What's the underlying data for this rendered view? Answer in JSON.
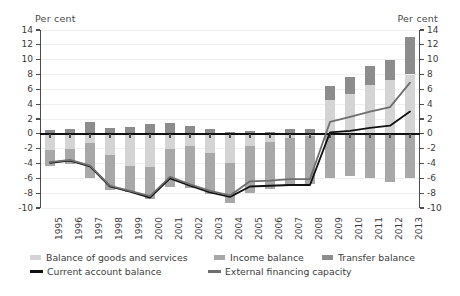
{
  "chart_data": {
    "type": "bar",
    "title": "",
    "subtitle": "",
    "xlabel": "",
    "ylabel": "Per cent",
    "ylabel_right": "Per cent",
    "ylim": [
      -10,
      14
    ],
    "yticks": [
      -10,
      -8,
      -6,
      -4,
      -2,
      0,
      2,
      4,
      6,
      8,
      10,
      12,
      14
    ],
    "ytick_labels": [
      "-10",
      "-8",
      "-6",
      "-4",
      "-2",
      "0",
      "2",
      "4",
      "6",
      "8",
      "10",
      "12",
      "14"
    ],
    "grid": true,
    "legend_position": "bottom",
    "stacked": true,
    "categories": [
      "1995",
      "1996",
      "1997",
      "1998",
      "1999",
      "2000",
      "2001",
      "2002",
      "2003",
      "2004",
      "2005",
      "2006",
      "2007",
      "2008",
      "2009",
      "2010",
      "2011",
      "2012",
      "2013"
    ],
    "series": [
      {
        "name": "Balance of goods and services",
        "type": "bar",
        "color": "#d4d4d4",
        "values": [
          -2.2,
          -2.0,
          -1.2,
          -2.8,
          -4.4,
          -4.5,
          -2.1,
          -1.6,
          -2.6,
          -3.9,
          -1.7,
          -1.1,
          -0.6,
          -0.3,
          4.5,
          5.4,
          6.6,
          7.2,
          8.0
        ]
      },
      {
        "name": "Income balance",
        "type": "bar",
        "color": "#a8a8a8",
        "values": [
          -2.1,
          -2.1,
          -4.8,
          -4.8,
          -3.5,
          -4.3,
          -5.1,
          -5.7,
          -5.5,
          -5.4,
          -6.3,
          -6.4,
          -6.5,
          -6.4,
          -6.0,
          -5.7,
          -6.0,
          -6.5,
          -6.0
        ]
      },
      {
        "name": "Transfer balance",
        "type": "bar",
        "color": "#8c8c8c",
        "values": [
          0.5,
          0.7,
          1.6,
          0.8,
          0.9,
          1.3,
          1.4,
          1.1,
          0.7,
          0.3,
          0.4,
          0.3,
          0.7,
          0.6,
          2.0,
          2.3,
          2.5,
          2.7,
          5.0
        ]
      },
      {
        "name": "Current account balance",
        "type": "line",
        "color": "#111111",
        "values": [
          -3.9,
          -3.6,
          -4.4,
          -7.1,
          -7.8,
          -8.6,
          -6.0,
          -7.0,
          -7.9,
          -8.5,
          -7.1,
          -7.0,
          -6.9,
          -6.9,
          0.2,
          0.4,
          0.8,
          1.1,
          3.0
        ]
      },
      {
        "name": "External financing capacity",
        "type": "line",
        "color": "#6e6e6e",
        "values": [
          -3.8,
          -3.5,
          -4.3,
          -7.0,
          -7.7,
          -8.4,
          -5.8,
          -6.8,
          -7.7,
          -8.3,
          -6.4,
          -6.3,
          -6.1,
          -6.1,
          1.6,
          2.3,
          3.0,
          3.6,
          6.9
        ]
      }
    ],
    "legend": [
      {
        "label": "Balance of goods and services",
        "marker": "swatch",
        "color": "#d4d4d4"
      },
      {
        "label": "Income balance",
        "marker": "swatch",
        "color": "#a8a8a8"
      },
      {
        "label": "Transfer balance",
        "marker": "swatch",
        "color": "#8c8c8c"
      },
      {
        "label": "Current account balance",
        "marker": "line",
        "color": "#111111"
      },
      {
        "label": "External financing capacity",
        "marker": "line",
        "color": "#6e6e6e"
      }
    ]
  }
}
